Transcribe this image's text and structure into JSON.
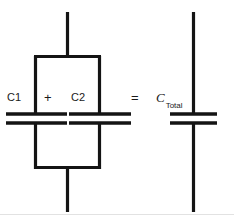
{
  "diagram": {
    "type": "circuit-schematic",
    "stroke_color": "#141414",
    "background_color": "#ffffff",
    "footer_rule_color": "#e2e2e2",
    "labels": {
      "c1": "C1",
      "plus": "+",
      "c2": "C2",
      "equals": "=",
      "ctotal_symbol": "C",
      "ctotal_subscript": "Total"
    },
    "left_network": {
      "name": "parallel-capacitor-network",
      "branches": [
        {
          "label": "C1",
          "position": "left"
        },
        {
          "label": "C2",
          "position": "right"
        }
      ],
      "top_lead": true,
      "bottom_lead": true
    },
    "right_network": {
      "name": "equivalent-capacitor",
      "branches": [
        {
          "label": "C Total",
          "position": "center"
        }
      ],
      "top_lead": true,
      "bottom_lead": true
    },
    "operators": [
      "+",
      "="
    ]
  }
}
